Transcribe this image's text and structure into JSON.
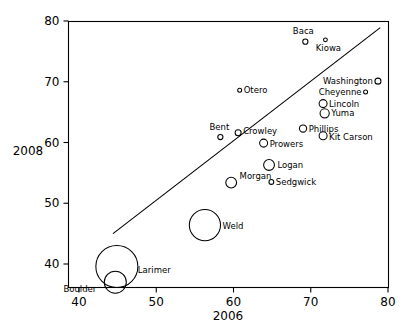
{
  "chart_data": {
    "type": "scatter",
    "title": "",
    "xlabel": "2006",
    "ylabel": "2008",
    "xlim": [
      40,
      80
    ],
    "ylim": [
      36,
      81
    ],
    "xticks": [
      40,
      50,
      60,
      70,
      80
    ],
    "yticks": [
      40,
      50,
      60,
      70,
      80
    ],
    "grid": false,
    "legend": "none",
    "annotations": "Bubble size encodes a third variable (population); a straight fit line is drawn through the cloud.",
    "fit_line": {
      "x0": 44.4,
      "y0": 45.0,
      "x1": 79.0,
      "y1": 78.9
    },
    "points": [
      {
        "label": "Baca",
        "x": 69.3,
        "y": 76.6,
        "size": 2.6
      },
      {
        "label": "Kiowa",
        "x": 71.9,
        "y": 76.9,
        "size": 1.9
      },
      {
        "label": "Washington",
        "x": 78.7,
        "y": 70.1,
        "size": 3.0
      },
      {
        "label": "Cheyenne",
        "x": 77.1,
        "y": 68.3,
        "size": 2.0
      },
      {
        "label": "Lincoln",
        "x": 71.6,
        "y": 66.4,
        "size": 4.0
      },
      {
        "label": "Yuma",
        "x": 71.8,
        "y": 64.8,
        "size": 4.6
      },
      {
        "label": "Otero",
        "x": 60.8,
        "y": 68.6,
        "size": 2.0
      },
      {
        "label": "Phillips",
        "x": 69.0,
        "y": 62.3,
        "size": 3.6
      },
      {
        "label": "Kit Carson",
        "x": 71.6,
        "y": 61.1,
        "size": 4.0
      },
      {
        "label": "Bent",
        "x": 58.3,
        "y": 60.9,
        "size": 2.6
      },
      {
        "label": "Crowley",
        "x": 60.6,
        "y": 61.6,
        "size": 3.0
      },
      {
        "label": "Prowers",
        "x": 63.9,
        "y": 59.9,
        "size": 4.0
      },
      {
        "label": "Logan",
        "x": 64.6,
        "y": 56.3,
        "size": 5.4
      },
      {
        "label": "Morgan",
        "x": 59.7,
        "y": 53.4,
        "size": 5.4
      },
      {
        "label": "Sedgwick",
        "x": 64.9,
        "y": 53.5,
        "size": 2.4
      },
      {
        "label": "Weld",
        "x": 56.3,
        "y": 46.4,
        "size": 15.6
      },
      {
        "label": "Larimer",
        "x": 44.9,
        "y": 39.6,
        "size": 21.0
      },
      {
        "label": "Boulder",
        "x": 44.7,
        "y": 37.0,
        "size": 11.0
      }
    ],
    "label_offsets": {
      "Baca": {
        "dx": -2,
        "dy": -8,
        "anchor": "middle"
      },
      "Kiowa": {
        "dx": 3,
        "dy": 11,
        "anchor": "middle"
      },
      "Washington": {
        "dx": -6,
        "dy": 3,
        "anchor": "end"
      },
      "Cheyenne": {
        "dx": -6,
        "dy": 3,
        "anchor": "end"
      },
      "Lincoln": {
        "dx": 6,
        "dy": 3,
        "anchor": "start"
      },
      "Yuma": {
        "dx": 6,
        "dy": 3,
        "anchor": "start"
      },
      "Otero": {
        "dx": 6,
        "dy": 3,
        "anchor": "start"
      },
      "Phillips": {
        "dx": 6,
        "dy": 3,
        "anchor": "start"
      },
      "Kit Carson": {
        "dx": 6,
        "dy": 4,
        "anchor": "start"
      },
      "Bent": {
        "dx": -1,
        "dy": -7,
        "anchor": "middle"
      },
      "Crowley": {
        "dx": 6,
        "dy": 1,
        "anchor": "start"
      },
      "Prowers": {
        "dx": 6,
        "dy": 4,
        "anchor": "start"
      },
      "Logan": {
        "dx": 7,
        "dy": 3,
        "anchor": "start"
      },
      "Morgan": {
        "dx": 7,
        "dy": -4,
        "anchor": "start"
      },
      "Sedgwick": {
        "dx": 6,
        "dy": 3,
        "anchor": "start"
      },
      "Weld": {
        "dx": 6,
        "dy": 4,
        "anchor": "start"
      },
      "Larimer": {
        "dx": 4,
        "dy": 7,
        "anchor": "start"
      },
      "Boulder": {
        "dx": -12,
        "dy": 10,
        "anchor": "end"
      }
    }
  }
}
